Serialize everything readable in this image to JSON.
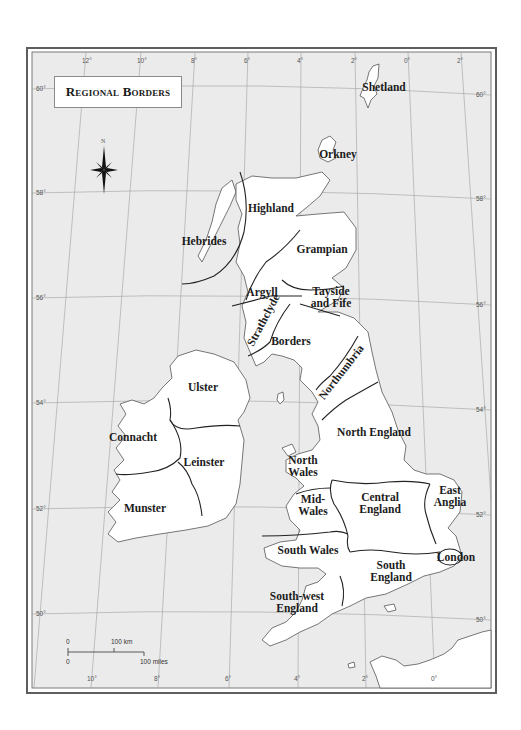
{
  "map": {
    "title": "Regional Borders",
    "compass": {
      "label": "N"
    },
    "colors": {
      "sea": "#ebebeb",
      "land": "#ffffff",
      "frame": "#6a6a6a",
      "border": "#222222",
      "grid": "#9a9a9a",
      "coast": "#555555"
    },
    "regions": [
      {
        "name": "Shetland",
        "x": 384,
        "y": 87
      },
      {
        "name": "Orkney",
        "x": 338,
        "y": 154
      },
      {
        "name": "Highland",
        "x": 271,
        "y": 208
      },
      {
        "name": "Hebrides",
        "x": 204,
        "y": 241
      },
      {
        "name": "Grampian",
        "x": 322,
        "y": 249
      },
      {
        "name": "Argyll",
        "x": 262,
        "y": 292
      },
      {
        "name": "Tayside\nand Fife",
        "x": 331,
        "y": 297
      },
      {
        "name": "Strathclyde",
        "x": 263,
        "y": 320,
        "rotate": -62
      },
      {
        "name": "Borders",
        "x": 291,
        "y": 341
      },
      {
        "name": "Northumbria",
        "x": 341,
        "y": 372,
        "rotate": -52
      },
      {
        "name": "Ulster",
        "x": 203,
        "y": 387
      },
      {
        "name": "Connacht",
        "x": 133,
        "y": 437
      },
      {
        "name": "Leinster",
        "x": 204,
        "y": 462
      },
      {
        "name": "North England",
        "x": 374,
        "y": 432
      },
      {
        "name": "North\nWales",
        "x": 303,
        "y": 466
      },
      {
        "name": "East\nAnglia",
        "x": 450,
        "y": 496
      },
      {
        "name": "Central\nEngland",
        "x": 380,
        "y": 503
      },
      {
        "name": "Mid-\nWales",
        "x": 313,
        "y": 505
      },
      {
        "name": "Munster",
        "x": 145,
        "y": 508
      },
      {
        "name": "South Wales",
        "x": 308,
        "y": 550
      },
      {
        "name": "London",
        "x": 456,
        "y": 557
      },
      {
        "name": "South\nEngland",
        "x": 391,
        "y": 571
      },
      {
        "name": "South-west\nEngland",
        "x": 297,
        "y": 602
      }
    ],
    "longitude_ticks_top": [
      {
        "label": "12°",
        "x": 86
      },
      {
        "label": "10°",
        "x": 141
      },
      {
        "label": "8°",
        "x": 195
      },
      {
        "label": "6°",
        "x": 248
      },
      {
        "label": "4°",
        "x": 301
      },
      {
        "label": "2°",
        "x": 355
      },
      {
        "label": "0°",
        "x": 408
      },
      {
        "label": "2°",
        "x": 461
      }
    ],
    "longitude_ticks_bottom": [
      {
        "label": "10°",
        "x": 91
      },
      {
        "label": "8°",
        "x": 158
      },
      {
        "label": "6°",
        "x": 229
      },
      {
        "label": "4°",
        "x": 298
      },
      {
        "label": "2°",
        "x": 366
      },
      {
        "label": "0°",
        "x": 435
      }
    ],
    "latitude_ticks_left": [
      {
        "label": "60°",
        "x": 36,
        "y": 89
      },
      {
        "label": "58°",
        "x": 36,
        "y": 193
      },
      {
        "label": "56°",
        "x": 36,
        "y": 298
      },
      {
        "label": "54°",
        "x": 36,
        "y": 403
      },
      {
        "label": "52°",
        "x": 36,
        "y": 509
      },
      {
        "label": "50°",
        "x": 36,
        "y": 614
      }
    ],
    "latitude_ticks_right": [
      {
        "label": "60°",
        "x": 476,
        "y": 95
      },
      {
        "label": "58°",
        "x": 476,
        "y": 199
      },
      {
        "label": "56°",
        "x": 476,
        "y": 305
      },
      {
        "label": "54°",
        "x": 476,
        "y": 410
      },
      {
        "label": "52°",
        "x": 476,
        "y": 515
      },
      {
        "label": "50°",
        "x": 476,
        "y": 620
      }
    ],
    "scale_bar": {
      "km_zero": "0",
      "km_label": "100 km",
      "mi_zero": "0",
      "mi_label": "100 miles"
    }
  }
}
